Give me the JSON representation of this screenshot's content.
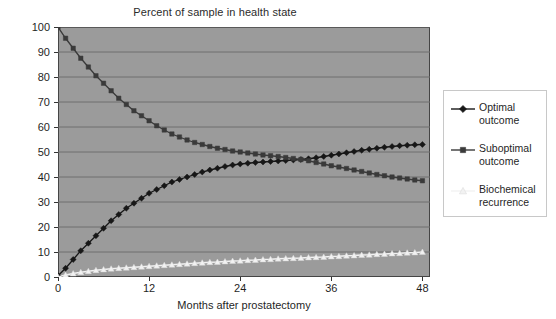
{
  "chart_data": {
    "type": "line",
    "title": "Percent of sample in health state",
    "xlabel": "Months after prostatectomy",
    "ylabel": "Percent",
    "xlim": [
      0,
      49
    ],
    "ylim": [
      0,
      100
    ],
    "xticks": [
      0,
      12,
      24,
      36,
      48
    ],
    "xtick_labels": [
      "0",
      "12",
      "24",
      "36",
      "48"
    ],
    "yticks": [
      0,
      10,
      20,
      30,
      40,
      50,
      60,
      70,
      80,
      90,
      100
    ],
    "ytick_labels": [
      "0",
      "10",
      "20",
      "30",
      "40",
      "50",
      "60",
      "70",
      "80",
      "90",
      "100"
    ],
    "grid": true,
    "grid_axis": "y",
    "legend_position": "right-outside",
    "plot_background": "#9b9b9b",
    "figure_background": "#ffffff",
    "x": [
      0,
      1,
      2,
      3,
      4,
      5,
      6,
      7,
      8,
      9,
      10,
      11,
      12,
      13,
      14,
      15,
      16,
      17,
      18,
      19,
      20,
      21,
      22,
      23,
      24,
      25,
      26,
      27,
      28,
      29,
      30,
      31,
      32,
      33,
      34,
      35,
      36,
      37,
      38,
      39,
      40,
      41,
      42,
      43,
      44,
      45,
      46,
      47,
      48
    ],
    "series": [
      {
        "name": "Optimal outcome",
        "marker": "diamond",
        "color": "#171717",
        "values": [
          0.5,
          3.5,
          7.0,
          10.5,
          13.5,
          16.5,
          19.5,
          22.5,
          25.0,
          27.5,
          29.5,
          31.5,
          33.5,
          35.0,
          36.5,
          38.0,
          39.0,
          40.0,
          41.0,
          42.0,
          42.8,
          43.5,
          44.2,
          44.8,
          45.2,
          45.5,
          45.8,
          46.0,
          46.2,
          46.4,
          46.6,
          46.8,
          47.0,
          47.3,
          47.7,
          48.2,
          48.7,
          49.2,
          49.7,
          50.2,
          50.7,
          51.1,
          51.5,
          51.9,
          52.2,
          52.5,
          52.7,
          52.9,
          53.0
        ]
      },
      {
        "name": "Suboptimal outcome",
        "marker": "square",
        "color": "#3a3a3a",
        "values": [
          100.0,
          95.5,
          91.5,
          87.5,
          84.0,
          80.5,
          77.5,
          74.5,
          71.5,
          69.0,
          66.5,
          64.5,
          62.5,
          60.5,
          58.8,
          57.2,
          56.0,
          54.8,
          53.8,
          53.0,
          52.2,
          51.5,
          51.0,
          50.4,
          50.0,
          49.6,
          49.2,
          48.8,
          48.5,
          48.2,
          47.8,
          47.4,
          47.0,
          46.5,
          45.8,
          45.2,
          44.5,
          44.0,
          43.4,
          42.8,
          42.2,
          41.6,
          41.0,
          40.5,
          40.0,
          39.6,
          39.2,
          38.8,
          38.5
        ]
      },
      {
        "name": "Biochemical recurrence",
        "marker": "triangle",
        "color": "#f2f2f2",
        "values": [
          0.0,
          0.8,
          1.4,
          1.9,
          2.3,
          2.7,
          3.0,
          3.3,
          3.5,
          3.7,
          3.9,
          4.1,
          4.3,
          4.5,
          4.7,
          4.9,
          5.1,
          5.3,
          5.5,
          5.7,
          5.9,
          6.0,
          6.2,
          6.4,
          6.5,
          6.7,
          6.8,
          7.0,
          7.1,
          7.3,
          7.4,
          7.5,
          7.6,
          7.8,
          7.9,
          8.0,
          8.2,
          8.3,
          8.5,
          8.6,
          8.8,
          8.9,
          9.1,
          9.2,
          9.4,
          9.5,
          9.7,
          9.8,
          10.0
        ]
      }
    ]
  },
  "legend": {
    "items": [
      {
        "label": "Optimal\noutcome",
        "marker": "diamond",
        "color": "#171717"
      },
      {
        "label": "Suboptimal\noutcome",
        "marker": "square",
        "color": "#3a3a3a"
      },
      {
        "label": "Biochemical\nrecurrence",
        "marker": "triangle",
        "color": "#f2f2f2"
      }
    ]
  }
}
